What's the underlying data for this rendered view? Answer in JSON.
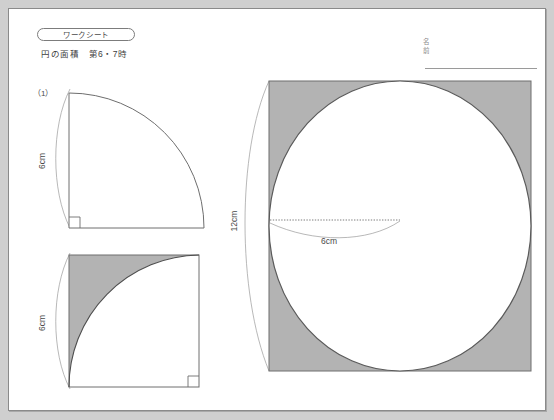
{
  "page": {
    "background_color": "#cfcfcf",
    "paper_color": "#ffffff",
    "border_color": "#8a8a8a"
  },
  "header": {
    "badge_label": "ワークシート",
    "subtitle": "円の面積　第6・7時",
    "name_label_top": "名",
    "name_label_bottom": "前"
  },
  "colors": {
    "shade_fill": "#b3b3b3",
    "stroke": "#6e6e6e",
    "thin_stroke": "#9a9a9a",
    "text": "#4a4a4a"
  },
  "figures": [
    {
      "id": "fig-quarter-circle",
      "question_number": "（1）",
      "shape": "quarter-circle",
      "radius_label": "6cm",
      "radius_cm": 6,
      "shaded": false,
      "right_angle_corner": "bottom-left"
    },
    {
      "id": "fig-square-minus-quarter",
      "shape": "square-with-quarter-arc",
      "side_label": "6cm",
      "side_cm": 6,
      "shaded": true,
      "shaded_region": "square-minus-quarter-circle",
      "right_angle_corner": "bottom-right"
    },
    {
      "id": "fig-square-with-inscribed-circle",
      "shape": "square-with-inscribed-circle",
      "side_label": "12cm",
      "side_cm": 12,
      "radius_label": "6cm",
      "radius_cm": 6,
      "shaded": true,
      "shaded_region": "square-minus-circle"
    }
  ]
}
